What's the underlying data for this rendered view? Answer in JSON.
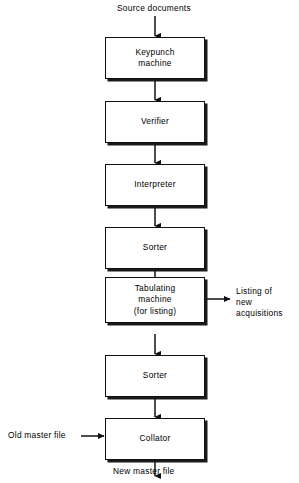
{
  "diagram": {
    "background_color": "#ffffff",
    "line_color": "#111111",
    "shadow_color": "#1a1a1a",
    "inputs": {
      "source_documents": "Source documents",
      "old_master_file": "Old master file"
    },
    "outputs": {
      "listing_line1": "Listing of",
      "listing_line2": "new",
      "listing_line3": "acquisitions",
      "new_master_file": "New master file"
    },
    "nodes": [
      {
        "id": "keypunch",
        "line1": "Keypunch",
        "line2": "machine",
        "line3": ""
      },
      {
        "id": "verifier",
        "line1": "Verifier",
        "line2": "",
        "line3": ""
      },
      {
        "id": "interpreter",
        "line1": "Interpreter",
        "line2": "",
        "line3": ""
      },
      {
        "id": "sorter1",
        "line1": "Sorter",
        "line2": "",
        "line3": ""
      },
      {
        "id": "tabulating",
        "line1": "Tabulating",
        "line2": "machine",
        "line3": "(for listing)"
      },
      {
        "id": "sorter2",
        "line1": "Sorter",
        "line2": "",
        "line3": ""
      },
      {
        "id": "collator",
        "line1": "Collator",
        "line2": "",
        "line3": ""
      }
    ]
  }
}
